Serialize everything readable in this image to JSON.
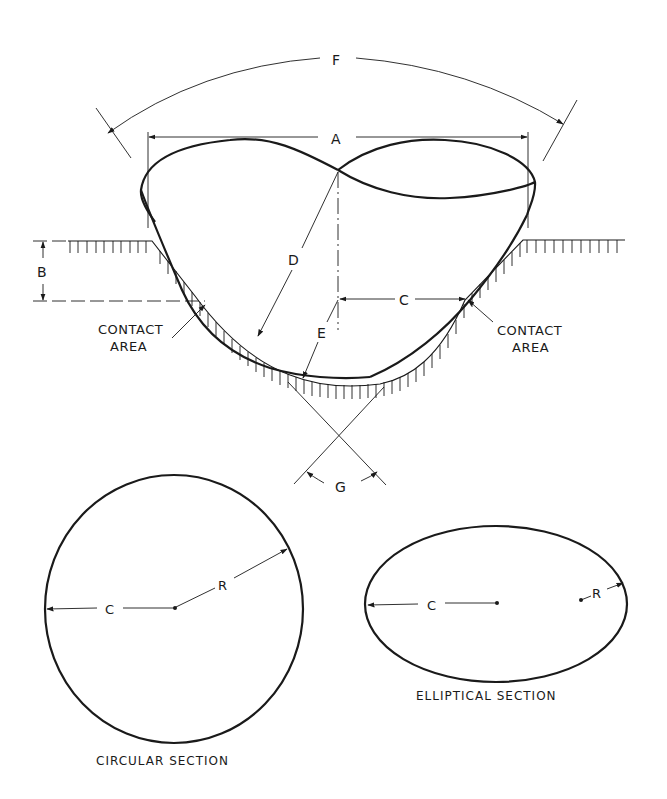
{
  "figure": {
    "type": "engineering-diagram",
    "colors": {
      "ink": "#1a1a1a",
      "paper": "#ffffff"
    },
    "dimensions": {
      "F": "F",
      "A": "A",
      "B": "B",
      "C": "C",
      "D": "D",
      "E": "E",
      "G": "G"
    },
    "annotations": {
      "contact_left_line1": "CONTACT",
      "contact_left_line2": "AREA",
      "contact_right_line1": "CONTACT",
      "contact_right_line2": "AREA"
    },
    "circular_section": {
      "label_c": "C",
      "label_r": "R",
      "caption": "CIRCULAR SECTION"
    },
    "elliptical_section": {
      "label_c": "C",
      "label_r": "R",
      "caption": "ELLIPTICAL SECTION"
    }
  }
}
